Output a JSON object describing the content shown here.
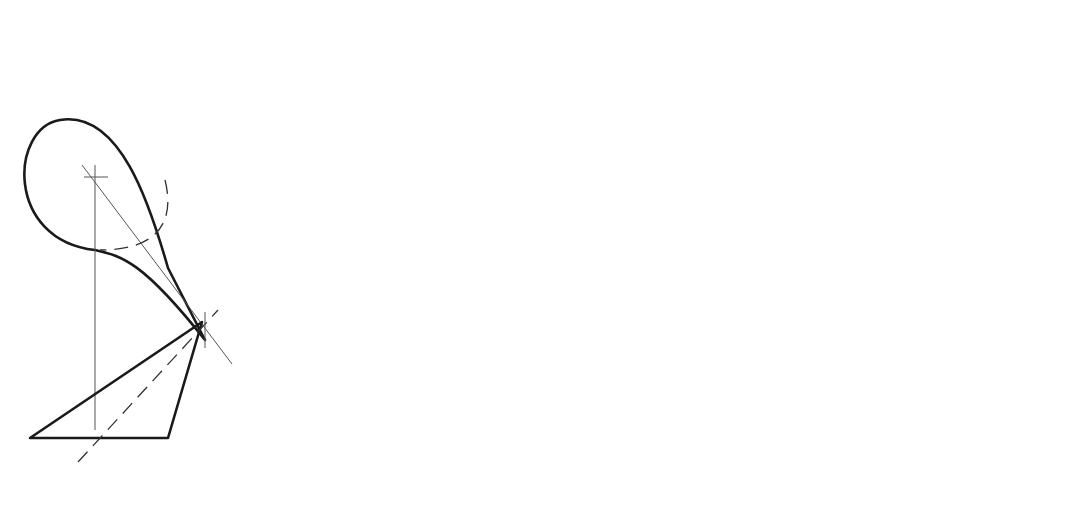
{
  "figure": {
    "panel_a": {
      "caption": "(a)",
      "labels": {
        "v": "V",
        "v_h": "H",
        "v_f": "F",
        "c": "C",
        "c_h": "H",
        "c_f": "F",
        "e_top": "e",
        "e_bottom": "e"
      }
    },
    "panel_b": {
      "caption": "(b)",
      "labels": {
        "t_top": "t",
        "t_bottom": "t",
        "p_top": "p",
        "p_bottom": "p",
        "v": "V",
        "v_h": "H",
        "v_f": "F",
        "c": "C",
        "c_h": "H",
        "c_f": "F",
        "e_top": "e",
        "e_bottom": "e"
      },
      "annotations": {
        "step_1": "1",
        "step_2": "2",
        "step_3": "3",
        "step_4": "4",
        "alternate": "Alternate",
        "parallel": "Parallel"
      }
    }
  }
}
